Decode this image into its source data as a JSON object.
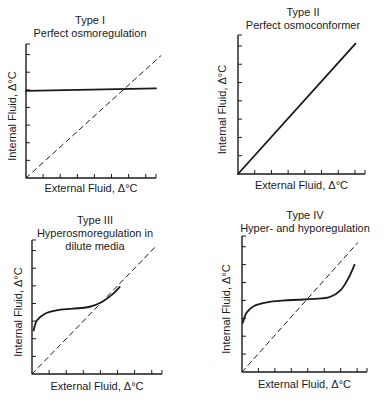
{
  "colors": {
    "ink": "#1a1a1a",
    "background": "#ffffff"
  },
  "chart_data": [
    {
      "type": "line",
      "panel": "top-left",
      "title": "Type I",
      "subtitle": "Perfect osmoregulation",
      "xlabel": "External Fluid, Δ°C",
      "ylabel": "Internal Fluid, Δ°C",
      "xlim": [
        0,
        8
      ],
      "ylim": [
        0,
        8
      ],
      "x_ticks": 7,
      "y_ticks": 7,
      "grid": false,
      "series": [
        {
          "name": "Internal fluid",
          "style": "solid",
          "x": [
            0,
            8
          ],
          "y": [
            5.2,
            5.35
          ]
        },
        {
          "name": "Isosmotic line",
          "style": "dashed",
          "x": [
            0,
            8.3
          ],
          "y": [
            0,
            7.3
          ]
        }
      ]
    },
    {
      "type": "line",
      "panel": "top-right",
      "title": "Type II",
      "subtitle": "Perfect osmoconformer",
      "xlabel": "External Fluid, Δ°C",
      "ylabel": "Internal Fluid, Δ°C",
      "xlim": [
        0,
        8
      ],
      "ylim": [
        0,
        8
      ],
      "x_ticks": 7,
      "y_ticks": 7,
      "grid": false,
      "series": [
        {
          "name": "Internal fluid",
          "style": "solid",
          "x": [
            0,
            7.4
          ],
          "y": [
            0,
            7.5
          ]
        }
      ]
    },
    {
      "type": "line",
      "panel": "bottom-left",
      "title": "Type III",
      "subtitle": "Hyperosmoregulation in dilute media",
      "subtitle_lines": [
        "Hyperosmoregulation in",
        "dilute media"
      ],
      "xlabel": "External Fluid, Δ°C",
      "ylabel": "Internal Fluid, Δ°C",
      "xlim": [
        0,
        8
      ],
      "ylim": [
        0,
        8
      ],
      "x_ticks": 7,
      "y_ticks": 7,
      "grid": false,
      "series": [
        {
          "name": "Internal fluid",
          "style": "solid",
          "x": [
            0.1,
            0.3,
            0.8,
            1.5,
            2.5,
            3.5,
            4.3,
            5.0,
            5.4
          ],
          "y": [
            2.6,
            3.2,
            3.6,
            3.8,
            3.9,
            4.0,
            4.3,
            4.8,
            5.2
          ]
        },
        {
          "name": "Isosmotic line",
          "style": "dashed",
          "x": [
            0,
            7.7
          ],
          "y": [
            0,
            7.7
          ]
        }
      ]
    },
    {
      "type": "line",
      "panel": "bottom-right",
      "title": "Type IV",
      "subtitle": "Hyper- and hyporegulation",
      "xlabel": "External Fluid, Δ°C",
      "ylabel": "Internal Fluid, Δ°C",
      "xlim": [
        0,
        8
      ],
      "ylim": [
        0,
        8
      ],
      "x_ticks": 7,
      "y_ticks": 7,
      "grid": false,
      "series": [
        {
          "name": "Internal fluid",
          "style": "solid",
          "x": [
            0.05,
            0.3,
            0.8,
            1.6,
            2.6,
            3.6,
            4.6,
            5.6,
            6.3,
            6.8,
            7.2
          ],
          "y": [
            2.9,
            3.5,
            3.9,
            4.1,
            4.2,
            4.25,
            4.3,
            4.4,
            4.8,
            5.5,
            6.3
          ]
        },
        {
          "name": "Isosmotic line",
          "style": "dashed",
          "x": [
            0,
            7.4
          ],
          "y": [
            0,
            7.6
          ]
        }
      ]
    }
  ]
}
